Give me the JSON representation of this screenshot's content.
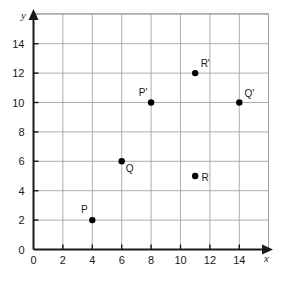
{
  "chart_data": {
    "type": "scatter",
    "title": "",
    "xlabel": "x",
    "ylabel": "y",
    "xlim": [
      0,
      16
    ],
    "ylim": [
      0,
      16
    ],
    "grid": true,
    "grid_step": 2,
    "legend": "none",
    "x_ticks": [
      "0",
      "2",
      "4",
      "6",
      "8",
      "10",
      "12",
      "14"
    ],
    "x_tick_values": [
      0,
      2,
      4,
      6,
      8,
      10,
      12,
      14
    ],
    "y_ticks": [
      "0",
      "2",
      "4",
      "6",
      "8",
      "10",
      "12",
      "14"
    ],
    "y_tick_values": [
      0,
      2,
      4,
      6,
      8,
      10,
      12,
      14
    ],
    "points": [
      {
        "label": "P",
        "x": 4,
        "y": 2,
        "label_dx": -8,
        "label_dy": -7
      },
      {
        "label": "Q",
        "x": 6,
        "y": 6,
        "label_dx": 8,
        "label_dy": 11
      },
      {
        "label": "R",
        "x": 11,
        "y": 5,
        "label_dx": 10,
        "label_dy": 5
      },
      {
        "label": "P'",
        "x": 8,
        "y": 10,
        "label_dx": -8,
        "label_dy": -7
      },
      {
        "label": "Q'",
        "x": 14,
        "y": 10,
        "label_dx": 10,
        "label_dy": -6
      },
      {
        "label": "R'",
        "x": 11,
        "y": 12,
        "label_dx": 10,
        "label_dy": -6
      }
    ],
    "point_color": "#000000",
    "grid_color": "#9a9a9a",
    "axis_color": "#1a1a1a"
  }
}
